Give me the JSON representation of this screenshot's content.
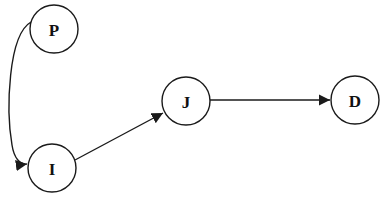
{
  "diagram": {
    "type": "directed-graph",
    "nodes": [
      {
        "id": "P",
        "label": "P",
        "cx": 54,
        "cy": 29,
        "r": 24
      },
      {
        "id": "I",
        "label": "I",
        "cx": 52,
        "cy": 168,
        "r": 24
      },
      {
        "id": "J",
        "label": "J",
        "cx": 186,
        "cy": 101,
        "r": 24
      },
      {
        "id": "D",
        "label": "D",
        "cx": 355,
        "cy": 100,
        "r": 24
      }
    ],
    "edges": [
      {
        "from": "P",
        "to": "I",
        "style": "curved"
      },
      {
        "from": "I",
        "to": "J",
        "style": "straight"
      },
      {
        "from": "J",
        "to": "D",
        "style": "straight"
      }
    ],
    "colors": {
      "stroke": "#1a1a1a",
      "fill": "#ffffff",
      "text": "#111111"
    }
  }
}
